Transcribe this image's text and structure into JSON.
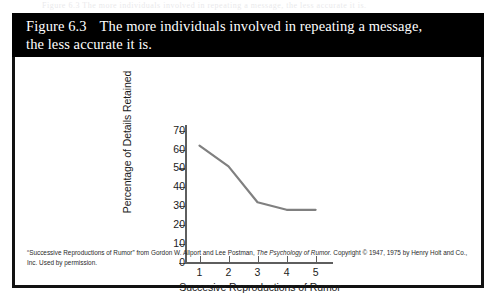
{
  "page": {
    "bleed_text": "Figure 6.3   The more individuals involved in repeating a message, the less accurate it is."
  },
  "figure": {
    "number": "Figure 6.3",
    "caption_line1": "The more individuals involved in repeating a message,",
    "caption_line2": "the less accurate it is.",
    "credit": {
      "part1": "“Successive Reproductions of Rumor” from Gordon W. Allport and Lee Postman, ",
      "italic": "The Psychology of Rumor.",
      "part2": " Copyright © 1947, 1975 by Henry Holt and Co., Inc. Used by permission."
    },
    "colors": {
      "header_background": "#000000",
      "header_text": "#ffffff",
      "frame": "#111111",
      "line_series": "#808080",
      "axis": "#5e5e5e"
    }
  },
  "chart_data": {
    "type": "line",
    "title": "",
    "xlabel": "Succesive Reproductions of Rumor",
    "ylabel": "Percentage of Details Retained",
    "x": [
      1,
      2,
      3,
      4,
      5
    ],
    "xticklabels": [
      "1",
      "2",
      "3",
      "4",
      "5"
    ],
    "yticklabels": [
      "0",
      "10",
      "20",
      "30",
      "40",
      "50",
      "60",
      "70"
    ],
    "yticks": [
      0,
      10,
      20,
      30,
      40,
      50,
      60,
      70
    ],
    "values": [
      62,
      51,
      32,
      28,
      28
    ],
    "xlim": [
      0.5,
      5.6
    ],
    "ylim": [
      0,
      73
    ],
    "grid": false,
    "legend": false,
    "series": [
      {
        "name": "Percentage of Details Retained",
        "color": "#808080",
        "values": [
          62,
          51,
          32,
          28,
          28
        ]
      }
    ]
  }
}
